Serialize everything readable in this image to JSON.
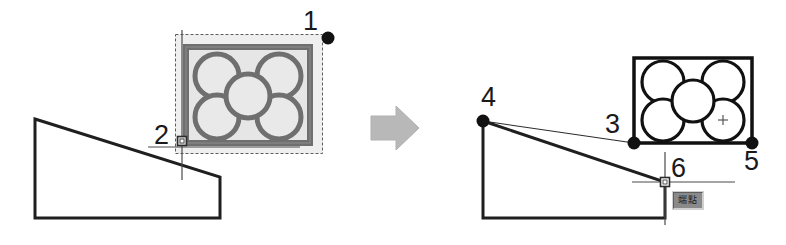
{
  "scene": {
    "title": "CAD copy-and-paste / move operation illustration",
    "background_color": "#ffffff",
    "ink_color": "#1a1a1a",
    "selection_color": "#707070",
    "selection_fill": "#e8e8e8",
    "arrow_color": "#b3b3b3",
    "tooltip_bg": "#8a8a8a",
    "tooltip_text_color": "#1d1d1d"
  },
  "labels": {
    "p1": "1",
    "p2": "2",
    "p3": "3",
    "p4": "4",
    "p5": "5",
    "p6": "6"
  },
  "tooltip": {
    "text": "端點"
  },
  "left_panel": {
    "name": "before-state",
    "polygon_points": "35,119 220,177 220,218 35,218",
    "selection_box": {
      "x": 175,
      "y": 34,
      "width": 147,
      "height": 119
    },
    "object_frame": {
      "x": 186,
      "y": 47,
      "width": 124,
      "height": 96
    },
    "circles": [
      {
        "cx": 217,
        "cy": 76,
        "r": 22
      },
      {
        "cx": 279,
        "cy": 76,
        "r": 22
      },
      {
        "cx": 217,
        "cy": 117,
        "r": 22
      },
      {
        "cx": 279,
        "cy": 117,
        "r": 22
      },
      {
        "cx": 248,
        "cy": 96,
        "r": 22
      }
    ],
    "grip_point": {
      "x": 328,
      "y": 38
    },
    "snap_marker": {
      "x": 182,
      "y": 141
    }
  },
  "arrow": {
    "name": "transition-arrow",
    "points": "371,116 396,116 396,108 418,128 396,148 396,140 371,140"
  },
  "right_panel": {
    "name": "after-state",
    "polygon_points": "483,121 665,182 665,218 483,218",
    "guide_line": {
      "x1": 483,
      "y1": 121,
      "x2": 634,
      "y2": 143
    },
    "object_frame": {
      "x": 634,
      "y": 58,
      "width": 118,
      "height": 85
    },
    "circles": [
      {
        "cx": 663,
        "cy": 82,
        "r": 21
      },
      {
        "cx": 723,
        "cy": 82,
        "r": 21
      },
      {
        "cx": 663,
        "cy": 120,
        "r": 21
      },
      {
        "cx": 723,
        "cy": 120,
        "r": 21
      },
      {
        "cx": 693,
        "cy": 101,
        "r": 21
      }
    ],
    "center_cross": {
      "x": 723,
      "y": 120
    },
    "points": [
      {
        "name": "point-3",
        "x": 634,
        "y": 143
      },
      {
        "name": "point-4",
        "x": 483,
        "y": 121
      },
      {
        "name": "point-5",
        "x": 752,
        "y": 143
      }
    ],
    "snap_marker": {
      "x": 665,
      "y": 182
    }
  }
}
